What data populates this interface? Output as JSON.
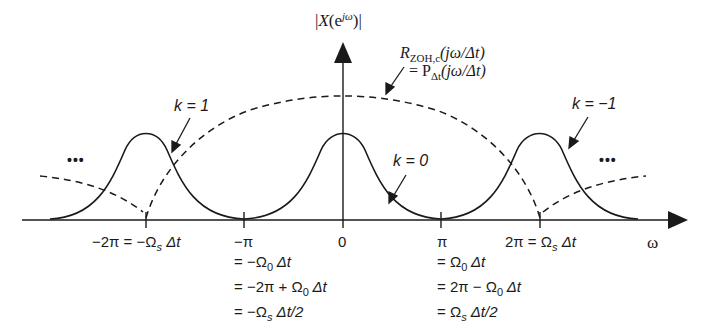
{
  "figure": {
    "y_axis_label": "|X(e^{jω})|",
    "x_axis_label": "ω",
    "envelope_label": {
      "line1": "R_{ZOH,c}(jω/Δt)",
      "line2": "= P_{Δt}(jω/Δt)"
    },
    "ellipsis_left": "•••",
    "ellipsis_right": "•••",
    "curve_labels": [
      {
        "k": "k = 1",
        "position": "left replica"
      },
      {
        "k": "k = 0",
        "position": "baseband"
      },
      {
        "k": "k = −1",
        "position": "right replica"
      }
    ],
    "ticks": [
      {
        "id": "neg2pi",
        "lines": [
          "−2π = −Ω_s Δt"
        ]
      },
      {
        "id": "negpi",
        "lines": [
          "−π",
          "= −Ω_0 Δt",
          "= −2π + Ω_0 Δt",
          "= −Ω_s Δt/2"
        ]
      },
      {
        "id": "zero",
        "lines": [
          "0"
        ]
      },
      {
        "id": "pi",
        "lines": [
          "π",
          "= Ω_0 Δt",
          "= 2π − Ω_0 Δt",
          "= Ω_s Δt/2"
        ]
      },
      {
        "id": "2pi",
        "lines": [
          "2π = Ω_s Δt"
        ]
      }
    ],
    "colors": {
      "ink": "#1a1a1a",
      "background": "#ffffff"
    }
  },
  "labels": {
    "k1": "k = 1",
    "k0": "k = 0",
    "km1": "k = −1",
    "omega": "ω",
    "dots": "•••",
    "tick_neg2pi_a": "−2π = −Ω",
    "tick_neg2pi_sub": "s",
    "tick_neg2pi_b": " Δt",
    "tick_negpi_1": "−π",
    "tick_negpi_2a": "= −Ω",
    "tick_negpi_2b": " Δt",
    "tick_negpi_3a": "= −2π + Ω",
    "tick_negpi_3b": " Δt",
    "tick_negpi_4a": "= −Ω",
    "tick_negpi_4b": " Δt/2",
    "tick_zero": "0",
    "tick_pi_1": "π",
    "tick_pi_2a": "= Ω",
    "tick_pi_2b": " Δt",
    "tick_pi_3a": "= 2π − Ω",
    "tick_pi_3b": " Δt",
    "tick_pi_4a": "= Ω",
    "tick_pi_4b": " Δt/2",
    "tick_2pi_a": "2π = Ω",
    "tick_2pi_b": " Δt",
    "sub_s": "s",
    "sub_0": "0",
    "yaxis_a": "|",
    "yaxis_X": "X",
    "yaxis_b": "(e",
    "yaxis_sup": "jω",
    "yaxis_c": ")|",
    "env1_R": "R",
    "env1_sub": "ZOH,c",
    "env1_rest": "(jω/Δt)",
    "env2_a": "= P",
    "env2_sub": "Δt",
    "env2_rest": "(jω/Δt)"
  }
}
